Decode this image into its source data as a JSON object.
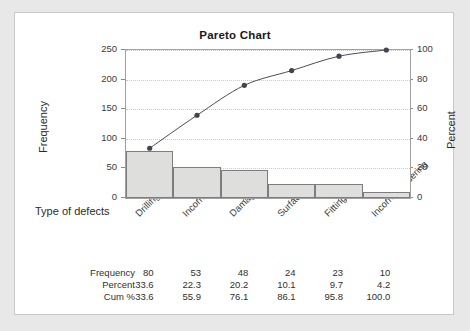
{
  "card": {
    "title": "Pareto Chart"
  },
  "chart_data": {
    "type": "bar",
    "title": "Pareto Chart",
    "xlabel": "Type of defects",
    "ylabel": "Frequency",
    "y2label": "Percent",
    "grid": true,
    "legend": "none",
    "categories": [
      "Drilling defects",
      "Incorrect Mesurement",
      "Damaged parts",
      "Surface cracks",
      "Fitting shortage",
      "Incorrect ordering"
    ],
    "series": [
      {
        "name": "Frequency",
        "kind": "bar",
        "axis": "left",
        "values": [
          80,
          53,
          48,
          24,
          23,
          10
        ]
      },
      {
        "name": "Cum %",
        "kind": "line",
        "axis": "right",
        "values": [
          33.6,
          55.9,
          76.1,
          86.1,
          95.8,
          100.0
        ]
      }
    ],
    "percent": [
      33.6,
      22.3,
      20.2,
      10.1,
      9.7,
      4.2
    ],
    "ylim": [
      0,
      250
    ],
    "yticks": [
      0,
      50,
      100,
      150,
      200,
      250
    ],
    "y2lim": [
      0,
      100
    ],
    "y2ticks": [
      0,
      20,
      40,
      60,
      80,
      100
    ],
    "bar_color": "#dededd",
    "bar_edge_color": "#7d7d7d",
    "line_color": "#4c4c5a",
    "marker_color": "#44444f",
    "gridline_color": "#c9c9d6"
  },
  "axis": {
    "y_left_label": "Frequency",
    "y_right_label": "Percent",
    "x_label": "Type of defects",
    "y_left_ticks": [
      "250",
      "200",
      "150",
      "100",
      "50",
      "0"
    ],
    "y_right_ticks": [
      "100",
      "80",
      "60",
      "40",
      "20",
      "0"
    ]
  },
  "table": {
    "rows": [
      {
        "label": "Frequency",
        "values": [
          "80",
          "53",
          "48",
          "24",
          "23",
          "10"
        ]
      },
      {
        "label": "Percent",
        "values": [
          "33.6",
          "22.3",
          "20.2",
          "10.1",
          "9.7",
          "4.2"
        ]
      },
      {
        "label": "Cum %",
        "values": [
          "33.6",
          "55.9",
          "76.1",
          "86.1",
          "95.8",
          "100.0"
        ]
      }
    ]
  }
}
